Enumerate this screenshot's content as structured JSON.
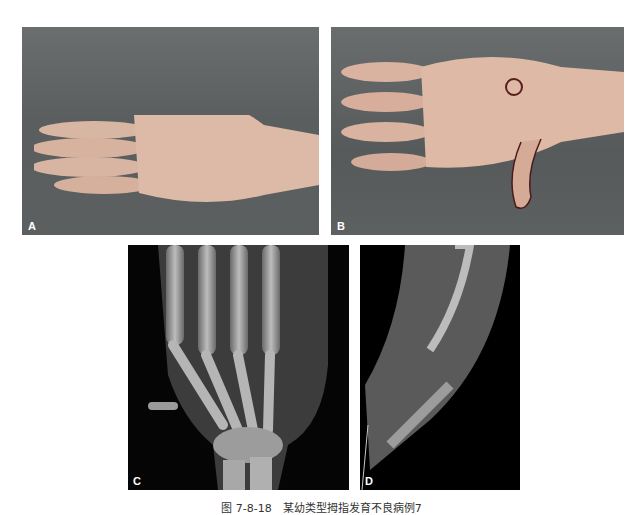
{
  "figure": {
    "panels": [
      {
        "id": "A",
        "label": "A",
        "description": "Photo of child's hand, palmar view, on gray drape"
      },
      {
        "id": "B",
        "label": "B",
        "description": "Photo of hand, dorsal view, with floating thumb marked"
      },
      {
        "id": "C",
        "label": "C",
        "description": "X-ray of hand showing hypoplastic thumb"
      },
      {
        "id": "D",
        "label": "D",
        "description": "X-ray of forearm"
      }
    ],
    "caption": "图 7-8-18　某幼类型拇指发育不良病例7"
  }
}
